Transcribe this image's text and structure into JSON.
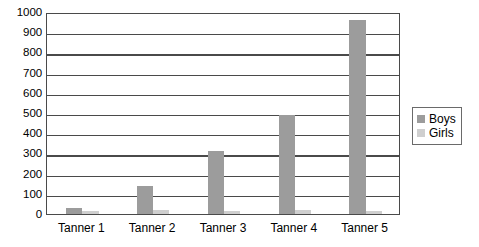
{
  "chart_data": {
    "type": "bar",
    "title": "",
    "subtitle": "",
    "xlabel": "",
    "ylabel": "",
    "categories": [
      "Tanner 1",
      "Tanner 2",
      "Tanner 3",
      "Tanner 4",
      "Tanner 5"
    ],
    "series": [
      {
        "name": "Boys",
        "color": "#9c9c9c",
        "values": [
          30,
          140,
          310,
          490,
          960
        ]
      },
      {
        "name": "Girls",
        "color": "#cfcfcf",
        "values": [
          15,
          18,
          15,
          22,
          15
        ]
      }
    ],
    "ylim": [
      0,
      1000
    ],
    "ytick_step": 100,
    "ytick_labels": [
      "0",
      "100",
      "200",
      "300",
      "400",
      "500",
      "600",
      "700",
      "800",
      "900",
      "1000"
    ],
    "grid": true,
    "grid_axis": "y",
    "legend_position": "right",
    "legend_entries": [
      "Boys",
      "Girls"
    ],
    "plot_border_color": "#4a4a4a",
    "background_color": "#ffffff"
  },
  "legend": {
    "boys_label": "Boys",
    "girls_label": "Girls"
  }
}
